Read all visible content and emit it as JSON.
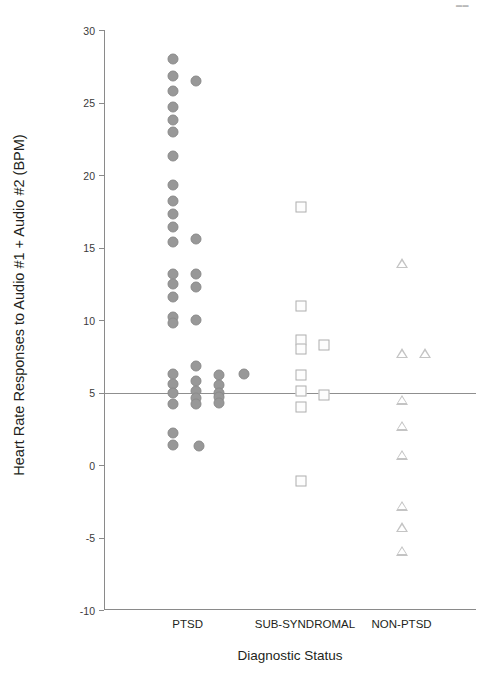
{
  "corner_mark": "▬▬",
  "chart_data": {
    "type": "scatter",
    "title": "",
    "xlabel": "Diagnostic Status",
    "ylabel": "Heart Rate Responses to Audio #1 + Audio #2 (BPM)",
    "ylim": [
      -10,
      30
    ],
    "yticks": [
      30,
      25,
      20,
      15,
      10,
      5,
      0,
      -5,
      -10
    ],
    "ytick_labels": [
      "30",
      "25",
      "20",
      "15",
      "10",
      "5",
      "0",
      "-5",
      "-10"
    ],
    "grid": false,
    "legend": "none",
    "reference_line": {
      "value": 5,
      "label": "",
      "color": "#8f8f8f"
    },
    "categories": [
      "PTSD",
      "SUB-SYNDROMAL",
      "NON-PTSD"
    ],
    "series": [
      {
        "name": "PTSD",
        "marker": "circle",
        "color": "#989898",
        "x_center": 0.215,
        "points": [
          {
            "jitter": -0.03,
            "y": 28.0
          },
          {
            "jitter": -0.03,
            "y": 26.8
          },
          {
            "jitter": 0.032,
            "y": 26.5
          },
          {
            "jitter": -0.03,
            "y": 25.8
          },
          {
            "jitter": -0.03,
            "y": 24.7
          },
          {
            "jitter": -0.03,
            "y": 23.8
          },
          {
            "jitter": -0.03,
            "y": 23.0
          },
          {
            "jitter": -0.03,
            "y": 21.3
          },
          {
            "jitter": -0.03,
            "y": 19.3
          },
          {
            "jitter": -0.03,
            "y": 18.2
          },
          {
            "jitter": -0.03,
            "y": 17.3
          },
          {
            "jitter": -0.03,
            "y": 16.4
          },
          {
            "jitter": 0.032,
            "y": 15.6
          },
          {
            "jitter": -0.03,
            "y": 15.4
          },
          {
            "jitter": -0.03,
            "y": 13.2
          },
          {
            "jitter": 0.032,
            "y": 13.2
          },
          {
            "jitter": -0.03,
            "y": 12.5
          },
          {
            "jitter": 0.032,
            "y": 12.3
          },
          {
            "jitter": -0.03,
            "y": 11.6
          },
          {
            "jitter": -0.03,
            "y": 10.2
          },
          {
            "jitter": 0.032,
            "y": 10.0
          },
          {
            "jitter": -0.03,
            "y": 9.8
          },
          {
            "jitter": -0.03,
            "y": 6.3
          },
          {
            "jitter": 0.032,
            "y": 6.8
          },
          {
            "jitter": 0.095,
            "y": 6.2
          },
          {
            "jitter": 0.16,
            "y": 6.3
          },
          {
            "jitter": -0.03,
            "y": 5.6
          },
          {
            "jitter": 0.032,
            "y": 5.8
          },
          {
            "jitter": 0.095,
            "y": 5.5
          },
          {
            "jitter": -0.03,
            "y": 5.0
          },
          {
            "jitter": 0.032,
            "y": 5.1
          },
          {
            "jitter": 0.095,
            "y": 5.0
          },
          {
            "jitter": 0.032,
            "y": 4.6
          },
          {
            "jitter": 0.095,
            "y": 4.7
          },
          {
            "jitter": -0.03,
            "y": 4.2
          },
          {
            "jitter": 0.032,
            "y": 4.2
          },
          {
            "jitter": 0.095,
            "y": 4.3
          },
          {
            "jitter": -0.03,
            "y": 2.2
          },
          {
            "jitter": -0.03,
            "y": 1.4
          },
          {
            "jitter": 0.04,
            "y": 1.3
          }
        ]
      },
      {
        "name": "SUB-SYNDROMAL",
        "marker": "square",
        "color": "#aeaeae",
        "x_center": 0.54,
        "points": [
          {
            "jitter": -0.01,
            "y": 17.8
          },
          {
            "jitter": -0.01,
            "y": 11.0
          },
          {
            "jitter": -0.01,
            "y": 8.6
          },
          {
            "jitter": -0.01,
            "y": 8.0
          },
          {
            "jitter": 0.052,
            "y": 8.3
          },
          {
            "jitter": -0.01,
            "y": 6.2
          },
          {
            "jitter": -0.01,
            "y": 5.1
          },
          {
            "jitter": 0.052,
            "y": 4.8
          },
          {
            "jitter": -0.01,
            "y": 4.0
          },
          {
            "jitter": -0.01,
            "y": -1.1
          }
        ]
      },
      {
        "name": "NON-PTSD",
        "marker": "triangle",
        "color": "#c4c4c4",
        "x_center": 0.8,
        "points": [
          {
            "jitter": 0.0,
            "y": 13.9
          },
          {
            "jitter": 0.0,
            "y": 7.7
          },
          {
            "jitter": 0.062,
            "y": 7.7
          },
          {
            "jitter": 0.0,
            "y": 4.5
          },
          {
            "jitter": 0.0,
            "y": 2.7
          },
          {
            "jitter": 0.0,
            "y": 0.7
          },
          {
            "jitter": 0.0,
            "y": -2.8
          },
          {
            "jitter": 0.0,
            "y": -4.3
          },
          {
            "jitter": 0.0,
            "y": -5.9
          }
        ]
      }
    ],
    "category_label_positions": [
      0.225,
      0.54,
      0.8
    ]
  }
}
